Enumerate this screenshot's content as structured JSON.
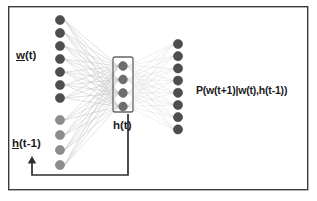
{
  "figure": {
    "kind": "neural-network-diagram",
    "width": 317,
    "height": 201,
    "background_color": "#ffffff",
    "border_color": "#3b3b3b"
  },
  "labels": {
    "input_word_prefix": "w",
    "input_word_suffix": "(t)",
    "input_word_full": "w(t)",
    "input_context_prefix": "h",
    "input_context_suffix": "(t-1)",
    "input_context_full": "h(t-1)",
    "hidden": "h(t)",
    "output_probability": "P(w(t+1)|w(t),h(t-1))"
  },
  "layers": {
    "input_word": {
      "name": "w(t)",
      "node_count": 7,
      "node_color": "#4e4e4e",
      "x": 60,
      "y_start": 20,
      "y_step": 13,
      "radius": 4.6
    },
    "input_context": {
      "name": "h(t-1)",
      "node_count": 4,
      "node_color": "#8d8d8d",
      "x": 60,
      "y_start": 120,
      "y_step": 15,
      "radius": 4.6
    },
    "hidden": {
      "name": "h(t)",
      "node_count": 4,
      "node_color": "#6e6e6e",
      "x": 123,
      "y_start": 66,
      "y_step": 13.5,
      "radius": 4.4,
      "box": {
        "x": 113,
        "y": 57,
        "width": 20,
        "height": 55,
        "rx": 2
      }
    },
    "output": {
      "name": "P(w(t+1)|w(t),h(t-1))",
      "node_count": 8,
      "node_color": "#4e4e4e",
      "x": 178,
      "y_start": 44,
      "y_step": 12.2,
      "radius": 4.6
    }
  },
  "connections": {
    "color": "#b9b9b9",
    "input_to_hidden": "fully-connected",
    "hidden_to_output": "fully-connected"
  },
  "feedback_loop": {
    "description": "recurrent connection from hidden layer h(t) back to context units h(t-1)",
    "color": "#2e2e2e",
    "from_x": 128,
    "from_y": 114,
    "bottom_y": 175,
    "to_x": 32,
    "to_y": 158
  },
  "frame": {
    "x": 8,
    "y": 6,
    "width": 300,
    "height": 184
  }
}
